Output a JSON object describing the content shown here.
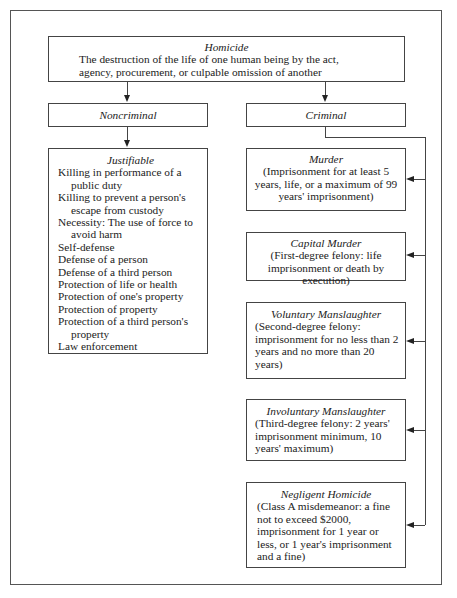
{
  "diagram": {
    "root": {
      "title": "Homicide",
      "description": "The destruction of the life of one human being by the act, agency, procurement, or culpable omission of another"
    },
    "noncriminal": {
      "title": "Noncriminal",
      "child": {
        "title": "Justifiable",
        "items": [
          "Killing in performance of a public duty",
          "Killing to prevent a person's escape from custody",
          "Necessity: The use of force to avoid harm",
          "Self-defense",
          "Defense of a person",
          "Defense of a third person",
          "Protection of life or health",
          "Protection of one's property",
          "Protection of property",
          "Protection of a third person's property",
          "Law enforcement"
        ]
      }
    },
    "criminal": {
      "title": "Criminal",
      "children": [
        {
          "title": "Murder",
          "description": "(Imprisonment for at least 5 years, life, or a maximum of 99 years' imprisonment)"
        },
        {
          "title": "Capital Murder",
          "description": "(First-degree felony: life imprisonment or death by execution)"
        },
        {
          "title": "Voluntary Manslaughter",
          "description": "(Second-degree felony: imprisonment for no less than 2 years and no more than 20 years)"
        },
        {
          "title": "Involuntary Manslaughter",
          "description": "(Third-degree felony: 2 years' imprisonment minimum, 10 years' maximum)"
        },
        {
          "title": "Negligent Homicide",
          "description": "(Class A misdemeanor: a fine not to exceed $2000, imprisonment for 1 year or less, or 1 year's imprisonment and a fine)"
        }
      ]
    }
  }
}
